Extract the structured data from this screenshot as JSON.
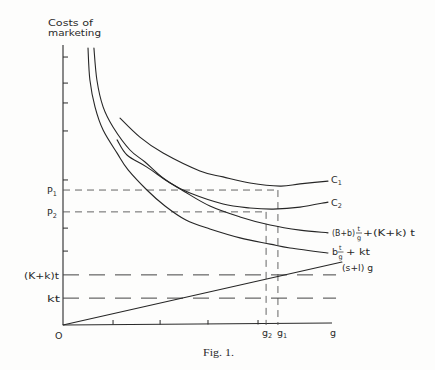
{
  "figure": {
    "caption": "Fig. 1.",
    "y_axis_title": {
      "line1": "Costs of",
      "line2": "marketing"
    },
    "x_axis_label": "g",
    "origin_label": "O",
    "y_labels": {
      "p1": {
        "main": "P",
        "sub": "1"
      },
      "p2": {
        "main": "P",
        "sub": "2"
      },
      "Kk_t": "(K+k)t",
      "kt": "kt"
    },
    "x_labels": {
      "g2": {
        "main": "g",
        "sub": "2"
      },
      "g1": {
        "main": "g",
        "sub": "1"
      }
    },
    "curve_labels": {
      "c1": {
        "main": "C",
        "sub": "1"
      },
      "c2": {
        "main": "C",
        "sub": "2"
      },
      "total_cost": {
        "prefix": "(B+b)",
        "num": "t",
        "den": "g",
        "suffix": "+(K+k) t"
      },
      "var_cost": {
        "prefix": "b",
        "num": "t",
        "den": "g",
        "suffix": "+ kt"
      },
      "line": "(s+l) g"
    }
  },
  "chart_data": {
    "type": "line",
    "title": "Fig. 1.",
    "xlabel": "g",
    "ylabel": "Costs of marketing",
    "xlim": [
      0,
      100
    ],
    "ylim": [
      0,
      100
    ],
    "grid": false,
    "legend": "none - curves labeled inline at right end",
    "axis_units": "normalized (no numeric tick labels shown)",
    "y_ticks_unlabeled": [
      95.7,
      86.4,
      79.3,
      69.3,
      51.8,
      34.6,
      26.4
    ],
    "x_ticks_unlabeled": [
      18.6,
      36.1,
      53.9,
      72.5
    ],
    "series": [
      {
        "name": "C1",
        "style": "solid",
        "points": [
          [
            21.2,
            73.9
          ],
          [
            28.6,
            67.1
          ],
          [
            37.2,
            61.4
          ],
          [
            50.9,
            55.0
          ],
          [
            59.5,
            52.9
          ],
          [
            69.5,
            50.7
          ],
          [
            80.7,
            49.6
          ],
          [
            88.1,
            50.4
          ],
          [
            98.5,
            51.4
          ]
        ]
      },
      {
        "name": "C2",
        "style": "solid",
        "points": [
          [
            20.1,
            66.1
          ],
          [
            23.8,
            60.7
          ],
          [
            31.2,
            56.4
          ],
          [
            39.8,
            50.7
          ],
          [
            47.2,
            47.1
          ],
          [
            59.5,
            43.2
          ],
          [
            69.5,
            41.8
          ],
          [
            78.1,
            41.4
          ],
          [
            88.1,
            42.1
          ],
          [
            98.5,
            43.9
          ]
        ]
      },
      {
        "name": "(B+b) t/g + (K+k) t",
        "style": "solid",
        "points": [
          [
            11.5,
            98.9
          ],
          [
            12.6,
            87.5
          ],
          [
            14.9,
            77.9
          ],
          [
            18.6,
            70.7
          ],
          [
            24.9,
            62.5
          ],
          [
            30.5,
            58.2
          ],
          [
            37.2,
            52.5
          ],
          [
            45.4,
            47.5
          ],
          [
            54.6,
            42.5
          ],
          [
            65.8,
            38.6
          ],
          [
            77.0,
            35.7
          ],
          [
            88.1,
            33.9
          ],
          [
            98.5,
            32.9
          ]
        ]
      },
      {
        "name": "b t/g + kt",
        "style": "solid",
        "points": [
          [
            9.3,
            98.9
          ],
          [
            10.0,
            87.5
          ],
          [
            11.9,
            77.9
          ],
          [
            14.9,
            69.6
          ],
          [
            20.1,
            61.4
          ],
          [
            24.2,
            55.4
          ],
          [
            31.2,
            48.2
          ],
          [
            37.9,
            42.5
          ],
          [
            45.7,
            37.5
          ],
          [
            54.6,
            34.3
          ],
          [
            65.8,
            31.1
          ],
          [
            77.0,
            28.9
          ],
          [
            84.4,
            27.5
          ],
          [
            98.5,
            25.7
          ]
        ]
      },
      {
        "name": "(s+l) g",
        "style": "solid",
        "points": [
          [
            0,
            0
          ],
          [
            103.7,
            22.5
          ]
        ]
      }
    ],
    "reference_lines": [
      {
        "name": "P1",
        "orientation": "horizontal",
        "y": 48.2,
        "x_from": 0,
        "x_to": 79.9,
        "style": "dashed"
      },
      {
        "name": "P2",
        "orientation": "horizontal",
        "y": 40.4,
        "x_from": 0,
        "x_to": 75.5,
        "style": "dashed"
      },
      {
        "name": "g1",
        "orientation": "vertical",
        "x": 79.9,
        "y_from": 0,
        "y_to": 48.2,
        "style": "dashed"
      },
      {
        "name": "g2",
        "orientation": "vertical",
        "x": 75.5,
        "y_from": 0,
        "y_to": 40.4,
        "style": "dashed"
      },
      {
        "name": "(K+k)t",
        "orientation": "horizontal",
        "y": 17.9,
        "x_from": 0,
        "x_to": 101.5,
        "style": "long-dashed"
      },
      {
        "name": "kt",
        "orientation": "horizontal",
        "y": 9.6,
        "x_from": 0,
        "x_to": 101.5,
        "style": "long-dashed"
      }
    ]
  }
}
